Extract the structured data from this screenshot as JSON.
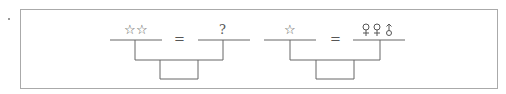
{
  "puzzle": {
    "equations": [
      {
        "left": "☆☆",
        "equals": "=",
        "right": "?"
      },
      {
        "left": "☆",
        "equals": "=",
        "right_symbols": [
          "female-symbol",
          "female-symbol",
          "arrow-circle-symbol"
        ]
      }
    ]
  }
}
